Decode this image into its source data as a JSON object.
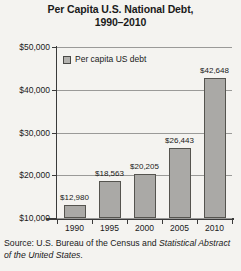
{
  "chart_data": {
    "type": "bar",
    "title": "Per Capita U.S. National Debt,",
    "title_line2": "1990–2010",
    "categories": [
      "1990",
      "1995",
      "2000",
      "2005",
      "2010"
    ],
    "values": [
      12980,
      18563,
      20205,
      26443,
      42648
    ],
    "value_labels": [
      "$12,980",
      "$18,563",
      "$20,205",
      "$26,443",
      "$42,648"
    ],
    "series": [
      {
        "name": "Per capita US debt",
        "values": [
          12980,
          18563,
          20205,
          26443,
          42648
        ]
      }
    ],
    "xlabel": "",
    "ylabel": "",
    "ylim": [
      10000,
      50000
    ],
    "ytick_values": [
      50000,
      40000,
      30000,
      20000,
      10000
    ],
    "ytick_labels": [
      "$50,000",
      "$40,000",
      "$30,000",
      "$20,000",
      "$10,000"
    ],
    "grid": true,
    "legend_position": "top-left-inside",
    "bar_color": "#aaa9a6",
    "bar_border_color": "#55544f",
    "gridline_color": "#9a9a98",
    "axis_color": "#3a3a3a",
    "background_color": "#f4f3f0"
  },
  "legend": {
    "items": [
      {
        "label": "Per capita US debt",
        "swatch_color": "#b3b2af"
      }
    ]
  },
  "source": {
    "prefix": "Source: U.S. Bureau of the Census and ",
    "italic": "Statistical Abstract of the United States",
    "suffix": "."
  }
}
